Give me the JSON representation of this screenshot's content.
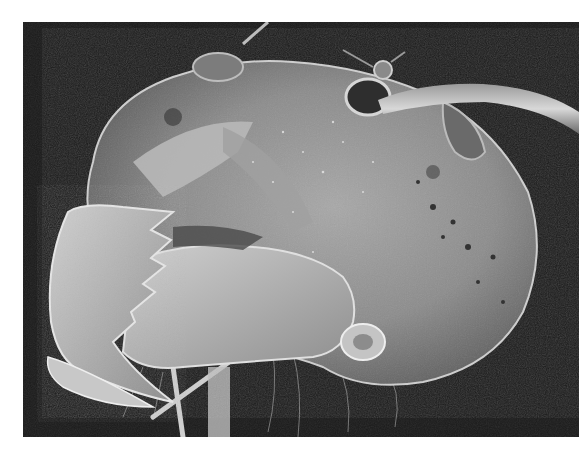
{
  "image": {
    "subject": "Scanning electron micrograph of an ant head with serrated mandibles and antenna",
    "colors": {
      "page_background": "#ffffff",
      "image_background": "#1c1c1c",
      "head_midtone": "#8a8a8a",
      "head_highlight": "#d8d8d8",
      "shadow": "#3a3a3a"
    }
  }
}
